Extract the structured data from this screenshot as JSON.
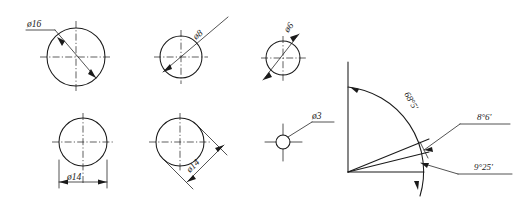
{
  "drawing": {
    "title": "Engineering drawing - diameter and angular dimensions",
    "background_color": "#ffffff",
    "line_color": "#1a1a1a",
    "views": [
      {
        "name": "circle-d16",
        "label": "ø16",
        "diameter_mm": 16,
        "leader_style": "horizontal-shelf",
        "center": [
          76,
          57
        ],
        "radius": 29
      },
      {
        "name": "circle-d8",
        "label": "ø8",
        "diameter_mm": 8,
        "leader_style": "rotated-30deg",
        "center": [
          181,
          57
        ],
        "radius": 21
      },
      {
        "name": "circle-d6",
        "label": "ø6",
        "diameter_mm": 6,
        "leader_style": "rotated-30deg",
        "center": [
          283,
          58
        ],
        "radius": 17
      },
      {
        "name": "circle-d14-horizontal",
        "label": "ø14",
        "diameter_mm": 14,
        "leader_style": "horizontal-dimension-line",
        "center": [
          83,
          142
        ],
        "radius": 24
      },
      {
        "name": "circle-d14-diagonal",
        "label": "ø14",
        "diameter_mm": 14,
        "leader_style": "diagonal-dimension-line",
        "center": [
          180,
          142
        ],
        "radius": 24
      },
      {
        "name": "circle-d3",
        "label": "ø3",
        "diameter_mm": 3,
        "leader_style": "horizontal-shelf",
        "center": [
          283,
          142
        ],
        "radius": 7
      }
    ],
    "angular_view": {
      "name": "angular-dimensions",
      "vertex": [
        348,
        172
      ],
      "arc_radius": 85,
      "angles": [
        {
          "name": "angle-68-5",
          "label": "68°5'",
          "degrees": 68,
          "minutes": 5,
          "placement": "along-arc"
        },
        {
          "name": "angle-8-6",
          "label": "8°6'",
          "degrees": 8,
          "minutes": 6,
          "placement": "upper-right-shelf"
        },
        {
          "name": "angle-9-25",
          "label": "9°25'",
          "degrees": 9,
          "minutes": 25,
          "placement": "lower-right-shelf"
        }
      ]
    }
  }
}
